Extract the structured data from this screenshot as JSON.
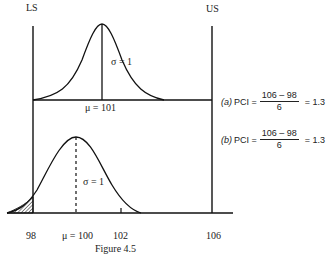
{
  "labels": {
    "lower_spec": "LS",
    "upper_spec": "US"
  },
  "panel_a": {
    "sigma_label": "σ = 1",
    "mean_label": "μ = 101",
    "formula": {
      "tag": "(a)",
      "name": "PCI =",
      "numerator": "106 – 98",
      "denominator": "6",
      "result": "= 1.3"
    }
  },
  "panel_b": {
    "sigma_label": "σ = 1",
    "axis_ticks": [
      "98",
      "μ = 100",
      "102",
      "106"
    ],
    "formula": {
      "tag": "(b)",
      "name": "PCI =",
      "numerator": "106 – 98",
      "denominator": "6",
      "result": "= 1.3"
    }
  },
  "caption": "Figure 4.5"
}
